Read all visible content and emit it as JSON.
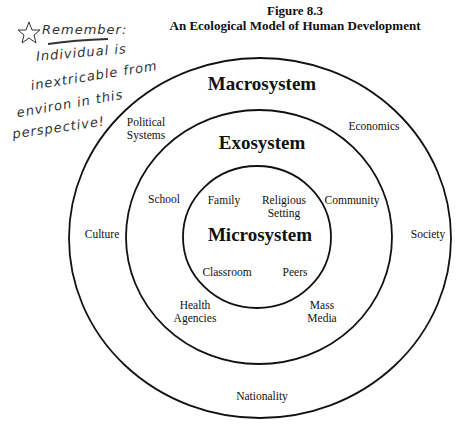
{
  "figure": {
    "number": "Figure 8.3",
    "title": "An Ecological Model of Human Development"
  },
  "annotation": {
    "icon": "star-icon",
    "lines": [
      "Remember:",
      "Individual is",
      "inextricable from",
      "environ in this",
      "perspective!"
    ]
  },
  "diagram": {
    "layers": [
      {
        "name": "Macrosystem",
        "items": [
          "Political Systems",
          "Economics",
          "Culture",
          "Society",
          "Nationality"
        ]
      },
      {
        "name": "Exosystem",
        "items": [
          "School",
          "Community",
          "Health Agencies",
          "Mass Media"
        ]
      },
      {
        "name": "Microsystem",
        "items": [
          "Family",
          "Religious Setting",
          "Classroom",
          "Peers"
        ]
      }
    ],
    "labels": {
      "macro": "Macrosystem",
      "exo": "Exosystem",
      "micro": "Microsystem",
      "political_1": "Political",
      "political_2": "Systems",
      "economics": "Economics",
      "culture": "Culture",
      "society": "Society",
      "nationality": "Nationality",
      "school": "School",
      "community": "Community",
      "health_1": "Health",
      "health_2": "Agencies",
      "mass_1": "Mass",
      "mass_2": "Media",
      "family": "Family",
      "religious_1": "Religious",
      "religious_2": "Setting",
      "classroom": "Classroom",
      "peers": "Peers"
    }
  }
}
